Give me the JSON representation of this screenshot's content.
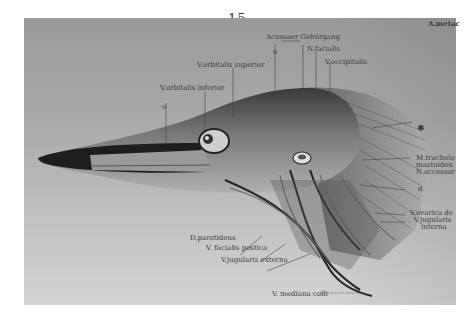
{
  "page_number": "15.",
  "top_right_label": "A.metac",
  "labels": {
    "acusseer_gehoergang": "Acussaer Gehörgang",
    "n_facialis": "N.facialis",
    "v_occipitalis": "V.occipitalis",
    "v_orbitalis_superior": "V.orbitalis superior",
    "v_orbitalis_inferior": "V.orbitalis inferior",
    "marker_o_top": "o",
    "marker_o_left": "·o",
    "marker_star": "✱",
    "m_trachelo_1": "M.trachelo",
    "m_trachelo_2": "mastoideu",
    "n_accessor": "N.accessor",
    "marker_d": "d",
    "v_ovarica": "V.ovarica de",
    "v_jugularis_int_1": "V.jugularis",
    "v_jugularis_int_2": "interna",
    "d_parotideus": "D.parotideus",
    "v_facialis_postica": "V. facialis postica",
    "v_jugularis_externa": "V.jugularis externa",
    "v_mediana_colli": "V. mediana colli"
  },
  "colors": {
    "page_bg": "#ffffff",
    "plate_bg": "#a8a8a8",
    "ink": "#3a3a3a",
    "beak_dark": "#1e1e1e"
  }
}
